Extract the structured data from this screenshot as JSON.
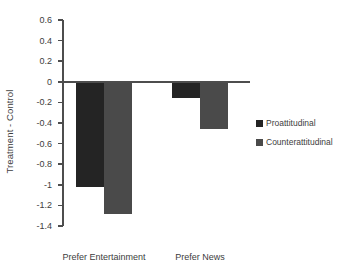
{
  "chart_data": {
    "type": "bar",
    "title": "",
    "xlabel": "",
    "ylabel": "Treatment - Control",
    "categories": [
      "Prefer Entertainment",
      "Prefer News"
    ],
    "series": [
      {
        "name": "Proattitudinal",
        "color": "#242424",
        "values": [
          -1.02,
          -0.16
        ]
      },
      {
        "name": "Counterattitudinal",
        "color": "#4a4a4a",
        "values": [
          -1.28,
          -0.46
        ]
      }
    ],
    "ylim": [
      -1.4,
      0.6
    ],
    "ytick_step": 0.2,
    "ytick_labels": [
      "0.6",
      "0.4",
      "0.2",
      "0",
      "-0.2",
      "-0.4",
      "-0.6",
      "-0.8",
      "-1",
      "-1.2",
      "-1.4"
    ],
    "ytick_values": [
      0.6,
      0.4,
      0.2,
      0,
      -0.2,
      -0.4,
      -0.6,
      -0.8,
      -1,
      -1.2,
      -1.4
    ],
    "grid": false,
    "legend_position": "right",
    "zero_line": 0
  },
  "axis": {
    "y_title": "Treatment - Control"
  },
  "legend": {
    "items": [
      {
        "label": "Proattitudinal"
      },
      {
        "label": "Counterattitudinal"
      }
    ]
  }
}
